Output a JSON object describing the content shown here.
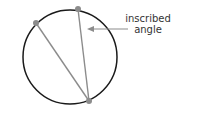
{
  "diagram": {
    "title": "Inscribed angle",
    "circle": {
      "cx": 70,
      "cy": 57,
      "r": 47,
      "stroke": "#1a1a1a"
    },
    "points": [
      {
        "name": "chord-endpoint-left",
        "x": 36,
        "y": 23
      },
      {
        "name": "chord-endpoint-top",
        "x": 78,
        "y": 9
      },
      {
        "name": "vertex",
        "x": 89,
        "y": 101
      }
    ],
    "chord_color": "#8c8c8c",
    "point_color": "#8c8c8c",
    "arrow": {
      "from_x": 128,
      "from_y": 29,
      "to_x": 87,
      "to_y": 29,
      "color": "#8c8c8c"
    },
    "label_line1": "inscribed",
    "label_line2": "angle"
  }
}
